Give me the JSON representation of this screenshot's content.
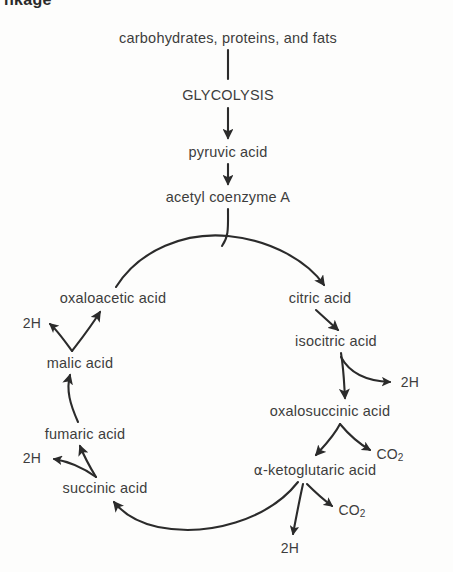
{
  "figure": {
    "heading_clipped": "nkage",
    "background_color": "#fdfdfc",
    "stroke_color": "#2b2b2b",
    "text_color": "#3d3d3d"
  },
  "diagram": {
    "type": "cycle-flow-diagram",
    "inputs": [
      {
        "id": "substrates",
        "label": "carbohydrates, proteins, and fats",
        "x": 228,
        "y": 38
      },
      {
        "id": "glycolysis",
        "label": "GLYCOLYSIS",
        "x": 228,
        "y": 95
      },
      {
        "id": "pyruvic",
        "label": "pyruvic acid",
        "x": 228,
        "y": 152
      },
      {
        "id": "acetyl-coa",
        "label": "acetyl coenzyme A",
        "x": 228,
        "y": 197
      }
    ],
    "cycle_nodes": [
      {
        "id": "oxaloacetic",
        "label": "oxaloacetic acid",
        "x": 113,
        "y": 298
      },
      {
        "id": "citric",
        "label": "citric acid",
        "x": 320,
        "y": 298
      },
      {
        "id": "isocitric",
        "label": "isocitric acid",
        "x": 336,
        "y": 341
      },
      {
        "id": "oxalosuccinic",
        "label": "oxalosuccinic acid",
        "x": 330,
        "y": 411
      },
      {
        "id": "ketoglutaric",
        "label": "-ketoglutaric acid",
        "label_prefix": "α",
        "x": 315,
        "y": 470
      },
      {
        "id": "succinic",
        "label": "succinic acid",
        "x": 105,
        "y": 488
      },
      {
        "id": "fumaric",
        "label": "fumaric acid",
        "x": 85,
        "y": 434
      },
      {
        "id": "malic",
        "label": "malic acid",
        "x": 80,
        "y": 363
      }
    ],
    "byproducts": [
      {
        "id": "h2-malic",
        "label": "2H",
        "x": 32,
        "y": 323
      },
      {
        "id": "h2-isocitric",
        "label": "2H",
        "x": 410,
        "y": 382
      },
      {
        "id": "co2-oxalosuccinic",
        "label": "CO",
        "sub": "2",
        "x": 390,
        "y": 455
      },
      {
        "id": "co2-ketoglutaric",
        "label": "CO",
        "sub": "2",
        "x": 352,
        "y": 511
      },
      {
        "id": "h2-ketoglutaric",
        "label": "2H",
        "x": 290,
        "y": 548
      },
      {
        "id": "h2-fumaric",
        "label": "2H",
        "x": 32,
        "y": 458
      }
    ]
  }
}
